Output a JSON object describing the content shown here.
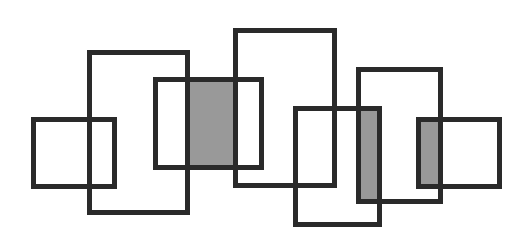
{
  "diagram": {
    "title": "",
    "stroke_color": "#2a2a2a",
    "stroke_width": 5,
    "fill_color": "#999999",
    "background": "#ffffff",
    "rectangles": [
      {
        "id": "A",
        "x": 31,
        "y": 117,
        "w": 86,
        "h": 72
      },
      {
        "id": "B",
        "x": 87,
        "y": 50,
        "w": 103,
        "h": 165
      },
      {
        "id": "C",
        "x": 153,
        "y": 77,
        "w": 111,
        "h": 93
      },
      {
        "id": "D",
        "x": 233,
        "y": 28,
        "w": 104,
        "h": 160
      },
      {
        "id": "E",
        "x": 293,
        "y": 106,
        "w": 89,
        "h": 121
      },
      {
        "id": "F",
        "x": 356,
        "y": 67,
        "w": 87,
        "h": 137
      },
      {
        "id": "G",
        "x": 416,
        "y": 117,
        "w": 86,
        "h": 72
      }
    ],
    "shaded_regions": [
      {
        "id": "C-between-B-D",
        "x": 188,
        "y": 80,
        "w": 47,
        "h": 87
      },
      {
        "id": "E-intersect-F",
        "x": 358,
        "y": 108,
        "w": 23,
        "h": 95
      },
      {
        "id": "F-intersect-G",
        "x": 418,
        "y": 119,
        "w": 24,
        "h": 68
      }
    ]
  }
}
